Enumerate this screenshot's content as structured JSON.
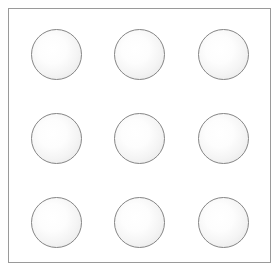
{
  "figure": {
    "title": "",
    "background_color": "#ffffff",
    "frame": {
      "x": 8,
      "y": 8,
      "width": 263,
      "height": 255,
      "border_color": "#9a9a9a",
      "border_width": 1,
      "fill_color": "#ffffff"
    }
  },
  "grid": {
    "rows": 3,
    "columns": 3,
    "count": 9,
    "circle_diameter": 51,
    "column_left_offsets": [
      22,
      105,
      189
    ],
    "row_top_offsets": [
      20,
      104,
      188
    ],
    "circle_style": {
      "stroke_color": "#858585",
      "stroke_width": 1,
      "fill_center_color": "#ffffff",
      "fill_edge_color": "#e2e2e2",
      "highlight_position": "42% 40%"
    },
    "circles": [
      {
        "id": "circle-r1-c1",
        "row": 1,
        "col": 1,
        "cx": 47,
        "cy": 45
      },
      {
        "id": "circle-r1-c2",
        "row": 1,
        "col": 2,
        "cx": 130,
        "cy": 45
      },
      {
        "id": "circle-r1-c3",
        "row": 1,
        "col": 3,
        "cx": 214,
        "cy": 45
      },
      {
        "id": "circle-r2-c1",
        "row": 2,
        "col": 1,
        "cx": 47,
        "cy": 129
      },
      {
        "id": "circle-r2-c2",
        "row": 2,
        "col": 2,
        "cx": 130,
        "cy": 129
      },
      {
        "id": "circle-r2-c3",
        "row": 2,
        "col": 3,
        "cx": 214,
        "cy": 129
      },
      {
        "id": "circle-r3-c1",
        "row": 3,
        "col": 1,
        "cx": 47,
        "cy": 213
      },
      {
        "id": "circle-r3-c2",
        "row": 3,
        "col": 2,
        "cx": 130,
        "cy": 213
      },
      {
        "id": "circle-r3-c3",
        "row": 3,
        "col": 3,
        "cx": 214,
        "cy": 213
      }
    ]
  }
}
